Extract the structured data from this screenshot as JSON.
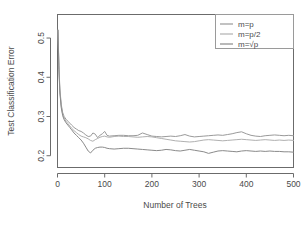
{
  "chart_data": {
    "type": "line",
    "title": "",
    "subtitle": "",
    "xlabel": "Number of Trees",
    "ylabel": "Test Classification Error",
    "xlim": [
      0,
      500
    ],
    "ylim": [
      0.17,
      0.56
    ],
    "xticks": [
      0,
      100,
      200,
      300,
      400,
      500
    ],
    "xtick_labels": [
      "0",
      "100",
      "200",
      "300",
      "400",
      "500"
    ],
    "yticks": [
      0.2,
      0.3,
      0.4,
      0.5
    ],
    "ytick_labels": [
      "0.2",
      "0.3",
      "0.4",
      "0.5"
    ],
    "grid": false,
    "legend_position": "top-right",
    "annotations": [],
    "series": [
      {
        "name": "m=p",
        "color": "#9a9a9a",
        "x": [
          1,
          3,
          5,
          8,
          11,
          14,
          18,
          22,
          26,
          30,
          35,
          40,
          45,
          50,
          55,
          60,
          65,
          70,
          75,
          80,
          85,
          90,
          95,
          100,
          105,
          110,
          120,
          130,
          140,
          150,
          160,
          170,
          180,
          190,
          200,
          210,
          220,
          230,
          240,
          250,
          260,
          270,
          280,
          290,
          300,
          310,
          320,
          330,
          340,
          350,
          360,
          370,
          380,
          390,
          400,
          410,
          420,
          430,
          440,
          450,
          460,
          470,
          480,
          490,
          500
        ],
        "y": [
          0.52,
          0.43,
          0.37,
          0.33,
          0.31,
          0.3,
          0.293,
          0.288,
          0.283,
          0.278,
          0.272,
          0.268,
          0.264,
          0.262,
          0.258,
          0.253,
          0.249,
          0.25,
          0.258,
          0.255,
          0.246,
          0.252,
          0.256,
          0.262,
          0.252,
          0.25,
          0.251,
          0.252,
          0.252,
          0.251,
          0.251,
          0.252,
          0.258,
          0.254,
          0.25,
          0.249,
          0.248,
          0.249,
          0.25,
          0.249,
          0.251,
          0.254,
          0.25,
          0.248,
          0.249,
          0.25,
          0.251,
          0.252,
          0.253,
          0.252,
          0.254,
          0.256,
          0.259,
          0.261,
          0.256,
          0.252,
          0.25,
          0.249,
          0.251,
          0.252,
          0.253,
          0.252,
          0.251,
          0.252,
          0.251
        ]
      },
      {
        "name": "m=p/2",
        "color": "#b0b0b0",
        "x": [
          1,
          3,
          5,
          8,
          11,
          14,
          18,
          22,
          26,
          30,
          35,
          40,
          45,
          50,
          55,
          60,
          65,
          70,
          75,
          80,
          85,
          90,
          95,
          100,
          105,
          110,
          120,
          130,
          140,
          150,
          160,
          170,
          180,
          190,
          200,
          210,
          220,
          230,
          240,
          250,
          260,
          270,
          280,
          290,
          300,
          310,
          320,
          330,
          340,
          350,
          360,
          370,
          380,
          390,
          400,
          410,
          420,
          430,
          440,
          450,
          460,
          470,
          480,
          490,
          500
        ],
        "y": [
          0.52,
          0.425,
          0.365,
          0.325,
          0.305,
          0.296,
          0.288,
          0.282,
          0.276,
          0.27,
          0.264,
          0.259,
          0.254,
          0.25,
          0.248,
          0.246,
          0.243,
          0.239,
          0.237,
          0.241,
          0.244,
          0.247,
          0.249,
          0.25,
          0.248,
          0.247,
          0.249,
          0.25,
          0.249,
          0.249,
          0.248,
          0.247,
          0.248,
          0.249,
          0.248,
          0.246,
          0.244,
          0.242,
          0.24,
          0.238,
          0.237,
          0.236,
          0.235,
          0.236,
          0.238,
          0.24,
          0.241,
          0.24,
          0.239,
          0.238,
          0.239,
          0.24,
          0.241,
          0.242,
          0.241,
          0.24,
          0.239,
          0.24,
          0.241,
          0.24,
          0.239,
          0.24,
          0.239,
          0.24,
          0.239
        ]
      },
      {
        "name": "m=√p",
        "color": "#8a8a8a",
        "x": [
          1,
          3,
          5,
          8,
          11,
          14,
          18,
          22,
          26,
          30,
          35,
          40,
          45,
          50,
          55,
          60,
          65,
          70,
          75,
          80,
          85,
          90,
          95,
          100,
          105,
          110,
          120,
          130,
          140,
          150,
          160,
          170,
          180,
          190,
          200,
          210,
          220,
          230,
          240,
          250,
          260,
          270,
          280,
          290,
          300,
          310,
          320,
          330,
          340,
          350,
          360,
          370,
          380,
          390,
          400,
          410,
          420,
          430,
          440,
          450,
          460,
          470,
          480,
          490,
          500
        ],
        "y": [
          0.52,
          0.42,
          0.36,
          0.322,
          0.302,
          0.292,
          0.284,
          0.278,
          0.272,
          0.266,
          0.258,
          0.252,
          0.246,
          0.24,
          0.232,
          0.222,
          0.212,
          0.207,
          0.214,
          0.219,
          0.221,
          0.222,
          0.222,
          0.221,
          0.219,
          0.218,
          0.217,
          0.218,
          0.219,
          0.219,
          0.218,
          0.217,
          0.216,
          0.215,
          0.214,
          0.213,
          0.214,
          0.216,
          0.215,
          0.213,
          0.212,
          0.214,
          0.216,
          0.214,
          0.212,
          0.21,
          0.206,
          0.209,
          0.212,
          0.213,
          0.212,
          0.211,
          0.21,
          0.212,
          0.213,
          0.212,
          0.211,
          0.212,
          0.211,
          0.212,
          0.211,
          0.211,
          0.21,
          0.21,
          0.209
        ]
      }
    ]
  },
  "legend": {
    "items": [
      {
        "label": "m=p"
      },
      {
        "label": "m=p/2"
      },
      {
        "label": "m=√p"
      }
    ]
  },
  "colors": {
    "axis": "#6b6b6b",
    "text": "#4a4a4a",
    "background": "#ffffff",
    "legend_border": "#9a9a9a"
  }
}
